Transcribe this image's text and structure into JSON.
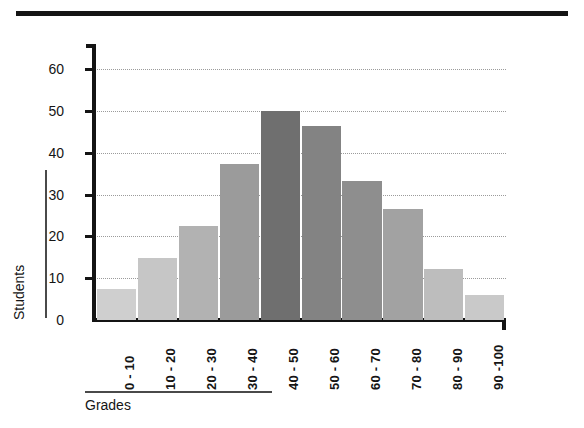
{
  "chart_data": {
    "type": "bar",
    "title": "",
    "subtitle": "",
    "xlabel": "Grades",
    "ylabel": "Students",
    "categories": [
      "0 - 10",
      "10 - 20",
      "20 - 30",
      "30 - 40",
      "40 - 50",
      "50 - 60",
      "60 - 70",
      "70 - 80",
      "80 - 90",
      "90 -100"
    ],
    "values": [
      7.5,
      14.8,
      22.5,
      37.3,
      50,
      46.5,
      33.2,
      26.6,
      12.2,
      6.1
    ],
    "series": [
      {
        "name": "Students",
        "values": [
          7.5,
          14.8,
          22.5,
          37.3,
          50,
          46.5,
          33.2,
          26.6,
          12.2,
          6.1
        ]
      }
    ],
    "bar_colors": [
      "#cfcfcf",
      "#c6c6c6",
      "#b2b2b2",
      "#9b9b9b",
      "#6f6f6f",
      "#838383",
      "#8e8e8e",
      "#a2a2a2",
      "#bdbdbd",
      "#c9c9c9"
    ],
    "ylim": [
      0,
      66
    ],
    "ytick_values": [
      0,
      10,
      20,
      30,
      40,
      50,
      60
    ],
    "ytick_labels": [
      "0",
      "10",
      "20",
      "30",
      "40",
      "50",
      "60"
    ],
    "grid": "horizontal-dotted",
    "legend": "none",
    "axis_color": "#141414",
    "gridline_color": "#9b9b9b"
  },
  "decor": {
    "top_rule_color": "#141414"
  }
}
